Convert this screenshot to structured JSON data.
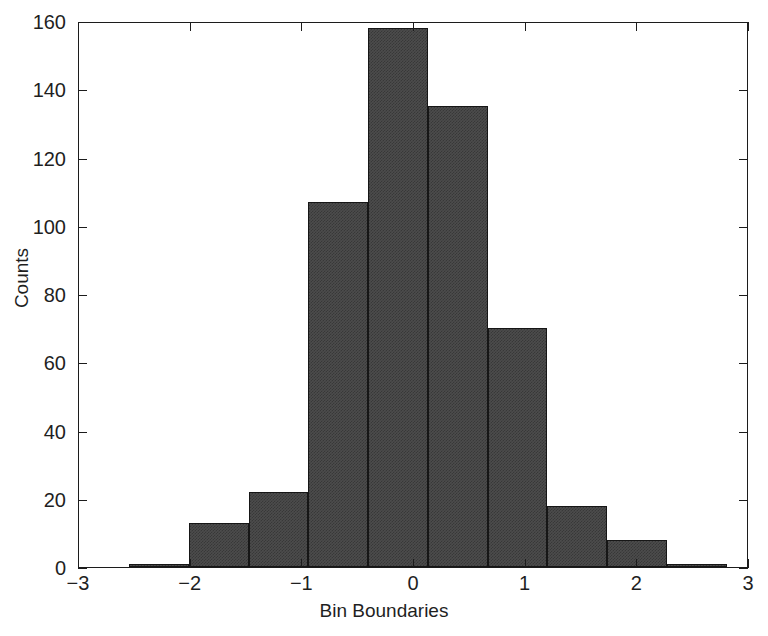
{
  "chart_data": {
    "type": "bar",
    "title": "",
    "subtitle": "",
    "xlabel": "Bin Boundaries",
    "ylabel": "Counts",
    "xlim": [
      -3,
      3
    ],
    "ylim": [
      0,
      160
    ],
    "xticks": [
      -3,
      -2,
      -1,
      0,
      1,
      2,
      3
    ],
    "xticklabels": [
      "−3",
      "−2",
      "−1",
      "0",
      "1",
      "2",
      "3"
    ],
    "yticks": [
      0,
      20,
      40,
      60,
      80,
      100,
      120,
      140,
      160
    ],
    "yticklabels": [
      "0",
      "20",
      "40",
      "60",
      "80",
      "100",
      "120",
      "140",
      "160"
    ],
    "grid": false,
    "legend": null,
    "bar_color": "#4c4c4c",
    "edge_color": "#161616",
    "background": "#ffffff",
    "bin_width": 0.535,
    "bin_edges": [
      -2.55,
      -2.015,
      -1.48,
      -0.945,
      -0.41,
      0.125,
      0.66,
      1.195,
      1.73,
      2.265,
      2.8
    ],
    "categories": [
      "-2.55 to -2.02",
      "-2.02 to -1.48",
      "-1.48 to -0.95",
      "-0.95 to -0.41",
      "-0.41 to 0.13",
      "0.13 to 0.66",
      "0.66 to 1.20",
      "1.20 to 1.73",
      "1.73 to 2.27",
      "2.27 to 2.80"
    ],
    "values": [
      1,
      13,
      22,
      107,
      158,
      135,
      70,
      18,
      8,
      1
    ],
    "series": [
      {
        "name": "Counts",
        "values": [
          1,
          13,
          22,
          107,
          158,
          135,
          70,
          18,
          8,
          1
        ]
      }
    ]
  }
}
